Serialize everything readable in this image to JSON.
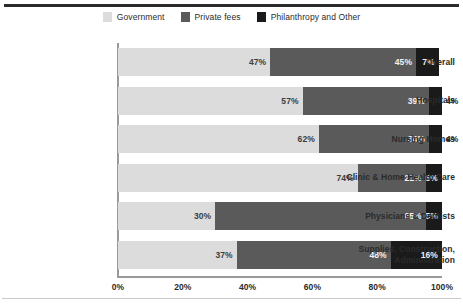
{
  "chart_data": {
    "type": "bar",
    "subtype": "stacked-horizontal-100",
    "title": "",
    "xlabel": "",
    "ylabel": "",
    "xlim": [
      0,
      100
    ],
    "grid": false,
    "legend_position": "top-center",
    "categories": [
      "Overall",
      "Hospitals",
      "Nursing Homes",
      "Clinic & Home Health Care",
      "Physicians & Dentists",
      "Supplies, Construction, Administration"
    ],
    "series": [
      {
        "name": "Government",
        "color": "#dcdcdc",
        "values": [
          47,
          57,
          62,
          74,
          30,
          37
        ]
      },
      {
        "name": "Private fees",
        "color": "#5a5a5a",
        "values": [
          45,
          39,
          34,
          21,
          65,
          48
        ]
      },
      {
        "name": "Philanthropy and Other",
        "color": "#1a1a1a",
        "values": [
          7,
          4,
          4,
          5,
          5,
          16
        ]
      }
    ],
    "xticks": [
      0,
      20,
      40,
      60,
      80,
      100
    ],
    "xtick_labels": [
      "0%",
      "20%",
      "40%",
      "60%",
      "80%",
      "100%"
    ]
  },
  "legend": {
    "items": [
      {
        "label": "Government",
        "color": "#dcdcdc"
      },
      {
        "label": "Private fees",
        "color": "#5a5a5a"
      },
      {
        "label": "Philanthropy and Other",
        "color": "#1a1a1a"
      }
    ]
  },
  "categories": [
    {
      "line1": "Overall",
      "line2": ""
    },
    {
      "line1": "Hospitals",
      "line2": ""
    },
    {
      "line1": "Nursing Homes",
      "line2": ""
    },
    {
      "line1": "Clinic & Home Health Care",
      "line2": ""
    },
    {
      "line1": "Physicians & Dentists",
      "line2": ""
    },
    {
      "line1": "Supplies, Construction,",
      "line2": "Administration"
    }
  ],
  "bars": [
    {
      "category": "Overall",
      "segments": [
        {
          "series": "Government",
          "value": 47,
          "label": "47%",
          "placement": "inside-light"
        },
        {
          "series": "Private fees",
          "value": 45,
          "label": "45%",
          "placement": "inside-dark"
        },
        {
          "series": "Philanthropy and Other",
          "value": 7,
          "label": "7%",
          "placement": "inside-dark"
        }
      ]
    },
    {
      "category": "Hospitals",
      "segments": [
        {
          "series": "Government",
          "value": 57,
          "label": "57%",
          "placement": "inside-light"
        },
        {
          "series": "Private fees",
          "value": 39,
          "label": "39%",
          "placement": "inside-dark"
        },
        {
          "series": "Philanthropy and Other",
          "value": 4,
          "label": "4%",
          "placement": "outside"
        }
      ]
    },
    {
      "category": "Nursing Homes",
      "segments": [
        {
          "series": "Government",
          "value": 62,
          "label": "62%",
          "placement": "inside-light"
        },
        {
          "series": "Private fees",
          "value": 34,
          "label": "34%",
          "placement": "inside-dark"
        },
        {
          "series": "Philanthropy and Other",
          "value": 4,
          "label": "4%",
          "placement": "outside"
        }
      ]
    },
    {
      "category": "Clinic & Home Health Care",
      "segments": [
        {
          "series": "Government",
          "value": 74,
          "label": "74%",
          "placement": "inside-light"
        },
        {
          "series": "Private fees",
          "value": 21,
          "label": "21%",
          "placement": "inside-dark"
        },
        {
          "series": "Philanthropy and Other",
          "value": 5,
          "label": "5%",
          "placement": "inside-dark"
        }
      ]
    },
    {
      "category": "Physicians & Dentists",
      "segments": [
        {
          "series": "Government",
          "value": 30,
          "label": "30%",
          "placement": "inside-light"
        },
        {
          "series": "Private fees",
          "value": 65,
          "label": "65%",
          "placement": "inside-dark"
        },
        {
          "series": "Philanthropy and Other",
          "value": 5,
          "label": "5%",
          "placement": "inside-dark"
        }
      ]
    },
    {
      "category": "Supplies, Construction, Administration",
      "segments": [
        {
          "series": "Government",
          "value": 37,
          "label": "37%",
          "placement": "inside-light"
        },
        {
          "series": "Private fees",
          "value": 48,
          "label": "48%",
          "placement": "inside-dark"
        },
        {
          "series": "Philanthropy and Other",
          "value": 16,
          "label": "16%",
          "placement": "inside-dark"
        }
      ]
    }
  ],
  "xaxis": {
    "ticks": [
      "0%",
      "20%",
      "40%",
      "60%",
      "80%",
      "100%"
    ]
  },
  "colors": {
    "government": "#dcdcdc",
    "private_fees": "#5a5a5a",
    "philanthropy": "#1a1a1a",
    "axis": "#9a9a9a",
    "text": "#2b2b2b",
    "rule_top": "#2b2b2b",
    "rule_bottom": "#c9c9c9"
  }
}
